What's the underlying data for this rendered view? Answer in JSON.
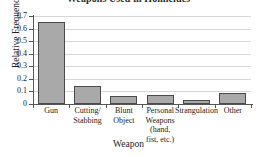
{
  "chart_data": {
    "type": "bar",
    "title": "Weapons Used in Homicides",
    "xlabel": "Weapon",
    "ylabel": "Relative Frequency",
    "categories": [
      "Gun",
      "Cutting/ Stabbing",
      "Blunt Object",
      "Personal Weapons (hand, fist, etc.)",
      "Strangulation",
      "Other"
    ],
    "category_lines": [
      [
        "Gun"
      ],
      [
        "Cutting/",
        "Stabbing"
      ],
      [
        "Blunt",
        "Object"
      ],
      [
        "Personal",
        "Weapons",
        "(hand,",
        "fist, etc.)"
      ],
      [
        "Strangulation"
      ],
      [
        "Other"
      ]
    ],
    "values": [
      0.65,
      0.14,
      0.065,
      0.075,
      0.035,
      0.09
    ],
    "ylim": [
      0,
      0.7
    ],
    "ytick_labels": [
      "0.7",
      "0.6",
      "0.5",
      "0.4",
      "0.3",
      "0.2",
      "0.1",
      "0"
    ],
    "ytick_values": [
      0.7,
      0.6,
      0.5,
      0.4,
      0.3,
      0.2,
      0.1,
      0
    ],
    "grid": true,
    "legend": false,
    "bar_color": "#a9a9a9",
    "bar_border_color": "#4a4a4a",
    "grid_color": "#d6d6d6",
    "axis_color": "#555555",
    "background": "#ffffff"
  }
}
